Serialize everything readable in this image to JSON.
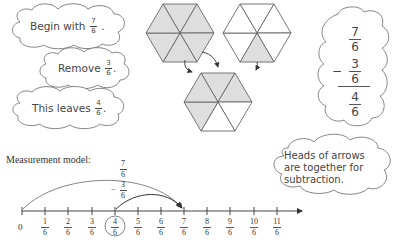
{
  "steps": [
    {
      "prefix": "Begin with",
      "fraction": {
        "num": "7",
        "den": "6"
      },
      "suffix": "."
    },
    {
      "prefix": "Remove",
      "fraction": {
        "num": "3",
        "den": "6"
      },
      "suffix": "."
    },
    {
      "prefix": "This leaves",
      "fraction": {
        "num": "4",
        "den": "6"
      },
      "suffix": "."
    }
  ],
  "area_model": {
    "hexagons": [
      {
        "name": "whole-hexagon",
        "shaded_count": 6,
        "shaded": [
          true,
          true,
          true,
          true,
          true,
          true
        ]
      },
      {
        "name": "one-sixth-hexagon",
        "shaded_count": 1,
        "shaded": [
          false,
          false,
          false,
          true,
          false,
          false
        ]
      },
      {
        "name": "result-hexagon",
        "shaded_count": 4,
        "shaded": [
          true,
          true,
          true,
          false,
          false,
          true
        ]
      }
    ],
    "shade_color": "#dedede"
  },
  "equation": {
    "minuend": {
      "num": "7",
      "den": "6"
    },
    "operator": "−",
    "subtrahend": {
      "num": "3",
      "den": "6"
    },
    "result": {
      "num": "4",
      "den": "6"
    }
  },
  "note": {
    "line1": "Heads of arrows",
    "line2": "are together for",
    "line3": "subtraction."
  },
  "measurement": {
    "title": "Measurement model:",
    "zero_label": "0",
    "ticks": [
      {
        "num": "1",
        "den": "6"
      },
      {
        "num": "2",
        "den": "6"
      },
      {
        "num": "3",
        "den": "6"
      },
      {
        "num": "4",
        "den": "6"
      },
      {
        "num": "5",
        "den": "6"
      },
      {
        "num": "6",
        "den": "6"
      },
      {
        "num": "7",
        "den": "6"
      },
      {
        "num": "8",
        "den": "6"
      },
      {
        "num": "9",
        "den": "6"
      },
      {
        "num": "10",
        "den": "6"
      },
      {
        "num": "11",
        "den": "6"
      }
    ],
    "circled_tick": "4/6",
    "arc_long": {
      "label_num": "7",
      "label_den": "6"
    },
    "arc_short": {
      "sign": "−",
      "label_num": "3",
      "label_den": "6"
    }
  }
}
